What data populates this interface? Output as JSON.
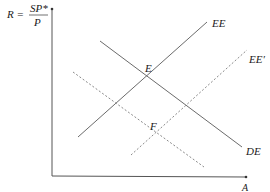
{
  "diagram": {
    "type": "economics-equilibrium-diagram",
    "y_axis": {
      "label_lhs": "R =",
      "label_numerator": "SP*",
      "label_denominator": "P"
    },
    "x_axis": {
      "label": "A"
    },
    "curves": [
      {
        "id": "EE",
        "label": "EE",
        "style": "solid",
        "slope": "upward"
      },
      {
        "id": "DE",
        "label": "DE",
        "style": "solid",
        "slope": "downward"
      },
      {
        "id": "EE_prime",
        "label": "EE′",
        "style": "dashed",
        "slope": "upward"
      },
      {
        "id": "DE_prime",
        "label": "",
        "style": "dashed",
        "slope": "downward"
      }
    ],
    "points": [
      {
        "id": "E",
        "label": "E",
        "description": "intersection of EE and DE"
      },
      {
        "id": "F",
        "label": "F",
        "description": "intersection of EE′ and dashed DE"
      }
    ],
    "colors": {
      "solid_line": "#6b6b6b",
      "dashed_line": "#8a8a8a",
      "axis": "#555555",
      "text": "#1a1a1a"
    }
  }
}
